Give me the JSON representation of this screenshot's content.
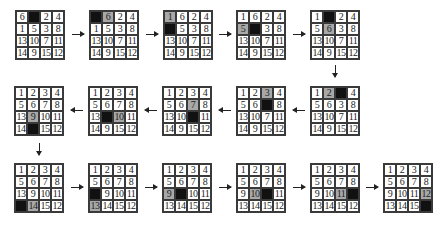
{
  "colors": {
    "blank": "#111111",
    "moved": "#a8a8a8",
    "line": "#3a3a3a"
  },
  "states": [
    {
      "id": 1,
      "x": 15,
      "y": 10,
      "cells": [
        "6",
        "",
        "2",
        "4",
        "1",
        "5",
        "3",
        "8",
        "13",
        "10",
        "7",
        "11",
        "14",
        "9",
        "15",
        "12"
      ],
      "blank": 1,
      "moved": -1
    },
    {
      "id": 2,
      "x": 89,
      "y": 10,
      "cells": [
        "",
        "6",
        "2",
        "4",
        "1",
        "5",
        "3",
        "8",
        "13",
        "10",
        "7",
        "11",
        "14",
        "9",
        "15",
        "12"
      ],
      "blank": 0,
      "moved": 1
    },
    {
      "id": 3,
      "x": 163,
      "y": 10,
      "cells": [
        "1",
        "6",
        "2",
        "4",
        "",
        "5",
        "3",
        "8",
        "13",
        "10",
        "7",
        "11",
        "14",
        "9",
        "15",
        "12"
      ],
      "blank": 4,
      "moved": 0
    },
    {
      "id": 4,
      "x": 236,
      "y": 10,
      "cells": [
        "1",
        "6",
        "2",
        "4",
        "5",
        "",
        "3",
        "8",
        "13",
        "10",
        "7",
        "11",
        "14",
        "9",
        "15",
        "12"
      ],
      "blank": 5,
      "moved": 4
    },
    {
      "id": 5,
      "x": 310,
      "y": 10,
      "cells": [
        "1",
        "",
        "2",
        "4",
        "5",
        "6",
        "3",
        "8",
        "13",
        "10",
        "7",
        "11",
        "14",
        "9",
        "15",
        "12"
      ],
      "blank": 1,
      "moved": 5
    },
    {
      "id": 6,
      "x": 310,
      "y": 86,
      "cells": [
        "1",
        "2",
        "",
        "4",
        "5",
        "6",
        "3",
        "8",
        "13",
        "10",
        "7",
        "11",
        "14",
        "9",
        "15",
        "12"
      ],
      "blank": 2,
      "moved": 1
    },
    {
      "id": 7,
      "x": 236,
      "y": 86,
      "cells": [
        "1",
        "2",
        "3",
        "4",
        "5",
        "6",
        "",
        "8",
        "13",
        "10",
        "7",
        "11",
        "14",
        "9",
        "15",
        "12"
      ],
      "blank": 6,
      "moved": 2
    },
    {
      "id": 8,
      "x": 162,
      "y": 86,
      "cells": [
        "1",
        "2",
        "3",
        "4",
        "5",
        "6",
        "7",
        "8",
        "13",
        "10",
        "",
        "11",
        "14",
        "9",
        "15",
        "12"
      ],
      "blank": 10,
      "moved": 6
    },
    {
      "id": 9,
      "x": 88,
      "y": 86,
      "cells": [
        "1",
        "2",
        "3",
        "4",
        "5",
        "6",
        "7",
        "8",
        "13",
        "",
        "10",
        "11",
        "14",
        "9",
        "15",
        "12"
      ],
      "blank": 9,
      "moved": 10
    },
    {
      "id": 10,
      "x": 14,
      "y": 86,
      "cells": [
        "1",
        "2",
        "3",
        "4",
        "5",
        "6",
        "7",
        "8",
        "13",
        "9",
        "10",
        "11",
        "14",
        "",
        "15",
        "12"
      ],
      "blank": 13,
      "moved": 9
    },
    {
      "id": 11,
      "x": 14,
      "y": 163,
      "cells": [
        "1",
        "2",
        "3",
        "4",
        "5",
        "6",
        "7",
        "8",
        "13",
        "9",
        "10",
        "11",
        "",
        "14",
        "15",
        "12"
      ],
      "blank": 12,
      "moved": 13
    },
    {
      "id": 12,
      "x": 88,
      "y": 163,
      "cells": [
        "1",
        "2",
        "3",
        "4",
        "5",
        "6",
        "7",
        "8",
        "",
        "9",
        "10",
        "11",
        "13",
        "14",
        "15",
        "12"
      ],
      "blank": 8,
      "moved": 12
    },
    {
      "id": 13,
      "x": 162,
      "y": 163,
      "cells": [
        "1",
        "2",
        "3",
        "4",
        "5",
        "6",
        "7",
        "8",
        "9",
        "",
        "10",
        "11",
        "13",
        "14",
        "15",
        "12"
      ],
      "blank": 9,
      "moved": 8
    },
    {
      "id": 14,
      "x": 236,
      "y": 163,
      "cells": [
        "1",
        "2",
        "3",
        "4",
        "5",
        "6",
        "7",
        "8",
        "9",
        "10",
        "",
        "11",
        "13",
        "14",
        "15",
        "12"
      ],
      "blank": 10,
      "moved": 9
    },
    {
      "id": 15,
      "x": 310,
      "y": 163,
      "cells": [
        "1",
        "2",
        "3",
        "4",
        "5",
        "6",
        "7",
        "8",
        "9",
        "10",
        "11",
        "",
        "13",
        "14",
        "15",
        "12"
      ],
      "blank": 11,
      "moved": 10
    },
    {
      "id": 16,
      "x": 383,
      "y": 163,
      "cells": [
        "1",
        "2",
        "3",
        "4",
        "5",
        "6",
        "7",
        "8",
        "9",
        "10",
        "11",
        "12",
        "13",
        "14",
        "15",
        ""
      ],
      "blank": 15,
      "moved": 11
    }
  ],
  "arrows": [
    {
      "dir": "right",
      "x": 72,
      "y": 34
    },
    {
      "dir": "right",
      "x": 146,
      "y": 34
    },
    {
      "dir": "right",
      "x": 219,
      "y": 34
    },
    {
      "dir": "right",
      "x": 293,
      "y": 34
    },
    {
      "dir": "down",
      "x": 335,
      "y": 65
    },
    {
      "dir": "left",
      "x": 293,
      "y": 110
    },
    {
      "dir": "left",
      "x": 219,
      "y": 110
    },
    {
      "dir": "left",
      "x": 145,
      "y": 110
    },
    {
      "dir": "left",
      "x": 71,
      "y": 110
    },
    {
      "dir": "down",
      "x": 39,
      "y": 143
    },
    {
      "dir": "right",
      "x": 71,
      "y": 187
    },
    {
      "dir": "right",
      "x": 145,
      "y": 187
    },
    {
      "dir": "right",
      "x": 219,
      "y": 187
    },
    {
      "dir": "right",
      "x": 293,
      "y": 187
    },
    {
      "dir": "right",
      "x": 366,
      "y": 187
    }
  ]
}
